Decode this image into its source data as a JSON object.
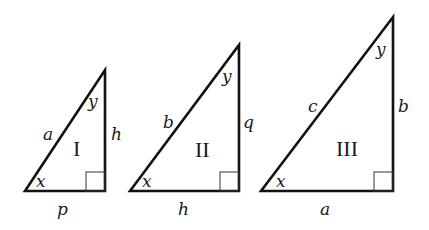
{
  "figure": {
    "triangles": [
      {
        "id": "I",
        "numeral": "I",
        "angles": {
          "bottom_left": "x",
          "top": "y"
        },
        "sides": {
          "hypotenuse": "a",
          "vertical": "h",
          "base": "p"
        },
        "right_angle": "bottom-right"
      },
      {
        "id": "II",
        "numeral": "II",
        "angles": {
          "bottom_left": "x",
          "top": "y"
        },
        "sides": {
          "hypotenuse": "b",
          "vertical": "q",
          "base": "h"
        },
        "right_angle": "bottom-right"
      },
      {
        "id": "III",
        "numeral": "III",
        "angles": {
          "bottom_left": "x",
          "top": "y"
        },
        "sides": {
          "hypotenuse": "c",
          "vertical": "b",
          "base": "a"
        },
        "right_angle": "bottom-right"
      }
    ]
  }
}
